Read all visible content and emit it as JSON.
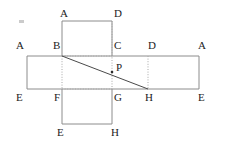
{
  "figure": {
    "width": 225,
    "height": 146,
    "background_color": "#ffffff",
    "stroke_color": "#8c8c8c",
    "dotted_color": "#a8a8a8",
    "diagonal_color": "#4a4a4a",
    "label_color": "#1c1c1c"
  },
  "labels": [
    {
      "id": "label-top-A",
      "text": "A",
      "x": 60,
      "y": 8
    },
    {
      "id": "label-top-D",
      "text": "D",
      "x": 114,
      "y": 8
    },
    {
      "id": "label-mid-A-left",
      "text": "A",
      "x": 16,
      "y": 40
    },
    {
      "id": "label-mid-B",
      "text": "B",
      "x": 53,
      "y": 40
    },
    {
      "id": "label-mid-C",
      "text": "C",
      "x": 114,
      "y": 40
    },
    {
      "id": "label-mid-D",
      "text": "D",
      "x": 148,
      "y": 40
    },
    {
      "id": "label-mid-A-right",
      "text": "A",
      "x": 198,
      "y": 40
    },
    {
      "id": "label-P",
      "text": "P",
      "x": 116,
      "y": 62
    },
    {
      "id": "label-bot-E-left",
      "text": "E",
      "x": 16,
      "y": 92
    },
    {
      "id": "label-bot-F",
      "text": "F",
      "x": 54,
      "y": 92
    },
    {
      "id": "label-bot-G",
      "text": "G",
      "x": 114,
      "y": 92
    },
    {
      "id": "label-bot-H",
      "text": "H",
      "x": 145,
      "y": 92
    },
    {
      "id": "label-bot-E-right",
      "text": "E",
      "x": 198,
      "y": 92
    },
    {
      "id": "label-base-E",
      "text": "E",
      "x": 57,
      "y": 127
    },
    {
      "id": "label-base-H",
      "text": "H",
      "x": 111,
      "y": 127
    }
  ],
  "geometry": {
    "top_face": {
      "left": 62,
      "top": 21,
      "right": 112,
      "bottom": 56
    },
    "middle_band": {
      "left": 27,
      "top": 56,
      "right": 199,
      "bottom": 89
    },
    "bottom_face": {
      "left": 62,
      "top": 89,
      "right": 112,
      "bottom": 124
    },
    "dotted_vertical_b_f": {
      "x": 62,
      "y1": 56,
      "y2": 89
    },
    "dotted_vertical_c_g": {
      "x": 112,
      "y1": 21,
      "y2": 89
    },
    "dotted_vertical_d_h": {
      "x": 148,
      "y1": 56,
      "y2": 89
    },
    "dotted_horizontal_f_g": {
      "y": 89,
      "x1": 62,
      "x2": 112
    },
    "dotted_horizontal_b_c": {
      "y": 56,
      "x1": 62,
      "x2": 112
    },
    "diagonal_BH": {
      "x1": 62,
      "y1": 56,
      "x2": 148,
      "y2": 89
    },
    "point_P": {
      "x": 112,
      "y": 72
    }
  },
  "artifacts": [
    {
      "id": "speck-top-left",
      "x": 19,
      "y": 20
    }
  ]
}
